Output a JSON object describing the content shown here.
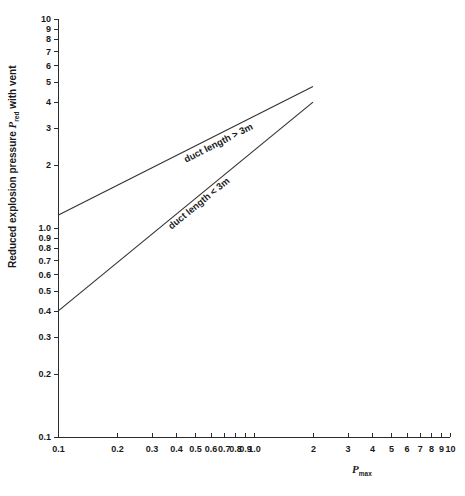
{
  "chart_data": {
    "type": "line",
    "title": "",
    "subtitle": "",
    "xlabel": "P",
    "xlabel_sub": "max",
    "ylabel_prefix": "Reduced explosion pressure ",
    "ylabel_symbol": "P",
    "ylabel_symbol_sub": "red",
    "ylabel_suffix": " with vent",
    "xscale": "log",
    "yscale": "log",
    "xlim": [
      0.1,
      10
    ],
    "ylim": [
      0.1,
      10
    ],
    "grid": false,
    "legend_position": "inline-annotations",
    "x_ticks": [
      {
        "value": 0.1,
        "label": "0.1"
      },
      {
        "value": 0.2,
        "label": "0.2"
      },
      {
        "value": 0.3,
        "label": "0.3"
      },
      {
        "value": 0.4,
        "label": "0.4"
      },
      {
        "value": 0.5,
        "label": "0.5"
      },
      {
        "value": 0.6,
        "label": "0.6"
      },
      {
        "value": 0.7,
        "label": "0.7"
      },
      {
        "value": 0.8,
        "label": "0.8"
      },
      {
        "value": 0.9,
        "label": "0.9"
      },
      {
        "value": 1.0,
        "label": "1.0"
      },
      {
        "value": 2,
        "label": "2"
      },
      {
        "value": 3,
        "label": "3"
      },
      {
        "value": 4,
        "label": "4"
      },
      {
        "value": 5,
        "label": "5"
      },
      {
        "value": 6,
        "label": "6"
      },
      {
        "value": 7,
        "label": "7"
      },
      {
        "value": 8,
        "label": "8"
      },
      {
        "value": 9,
        "label": "9"
      },
      {
        "value": 10,
        "label": "10"
      }
    ],
    "y_ticks": [
      {
        "value": 0.1,
        "label": "0.1"
      },
      {
        "value": 0.2,
        "label": "0.2"
      },
      {
        "value": 0.3,
        "label": "0.3"
      },
      {
        "value": 0.4,
        "label": "0.4"
      },
      {
        "value": 0.5,
        "label": "0.5"
      },
      {
        "value": 0.6,
        "label": "0.6"
      },
      {
        "value": 0.7,
        "label": "0.7"
      },
      {
        "value": 0.8,
        "label": "0.8"
      },
      {
        "value": 0.9,
        "label": "0.9"
      },
      {
        "value": 1.0,
        "label": "1.0"
      },
      {
        "value": 2,
        "label": "2"
      },
      {
        "value": 3,
        "label": "3"
      },
      {
        "value": 4,
        "label": "4"
      },
      {
        "value": 5,
        "label": "5"
      },
      {
        "value": 6,
        "label": "6"
      },
      {
        "value": 7,
        "label": "7"
      },
      {
        "value": 8,
        "label": "8"
      },
      {
        "value": 9,
        "label": "9"
      },
      {
        "value": 10,
        "label": "10"
      }
    ],
    "series": [
      {
        "name": "duct length > 3m",
        "label": "duct length > 3m",
        "x": [
          0.1,
          2.0
        ],
        "y": [
          1.15,
          4.75
        ],
        "label_x": 0.45,
        "label_y": 2.05
      },
      {
        "name": "duct length < 3m",
        "label": "duct length < 3m",
        "x": [
          0.1,
          2.0
        ],
        "y": [
          0.4,
          4.0
        ],
        "label_x": 0.38,
        "label_y": 0.98
      }
    ]
  },
  "annotations": {
    "line_upper_label": "duct length > 3m",
    "line_lower_label": "duct length < 3m"
  }
}
